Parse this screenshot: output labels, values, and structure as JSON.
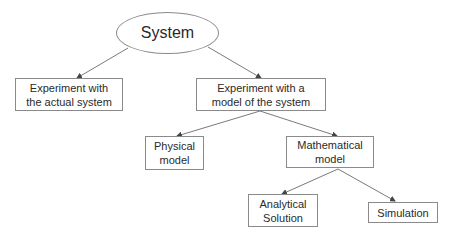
{
  "diagram": {
    "type": "tree",
    "root": {
      "label": "System",
      "shape": "ellipse"
    },
    "nodes": [
      {
        "id": "system",
        "label": "System",
        "shape": "ellipse",
        "x": 116,
        "y": 12,
        "w": 103,
        "h": 42
      },
      {
        "id": "actual",
        "label": "Experiment with\nthe actual system",
        "shape": "rect",
        "x": 15,
        "y": 78,
        "w": 108,
        "h": 33
      },
      {
        "id": "model",
        "label": "Experiment with a\nmodel of the system",
        "shape": "rect",
        "x": 196,
        "y": 78,
        "w": 130,
        "h": 33
      },
      {
        "id": "physical",
        "label": "Physical\nmodel",
        "shape": "rect",
        "x": 145,
        "y": 136,
        "w": 59,
        "h": 34
      },
      {
        "id": "math",
        "label": "Mathematical\nmodel",
        "shape": "rect",
        "x": 286,
        "y": 136,
        "w": 88,
        "h": 32
      },
      {
        "id": "analytical",
        "label": "Analytical\nSolution",
        "shape": "rect",
        "x": 248,
        "y": 194,
        "w": 70,
        "h": 33
      },
      {
        "id": "simulation",
        "label": "Simulation",
        "shape": "rect",
        "x": 368,
        "y": 202,
        "w": 70,
        "h": 21
      }
    ],
    "edges": [
      {
        "from": "system",
        "to": "actual",
        "x1": 128,
        "y1": 48,
        "x2": 77,
        "y2": 78
      },
      {
        "from": "system",
        "to": "model",
        "x1": 208,
        "y1": 47,
        "x2": 261,
        "y2": 78
      },
      {
        "from": "model",
        "to": "physical",
        "x1": 260,
        "y1": 111,
        "x2": 177,
        "y2": 136
      },
      {
        "from": "model",
        "to": "math",
        "x1": 260,
        "y1": 111,
        "x2": 337,
        "y2": 136
      },
      {
        "from": "math",
        "to": "analytical",
        "x1": 338,
        "y1": 169,
        "x2": 282,
        "y2": 194
      },
      {
        "from": "math",
        "to": "simulation",
        "x1": 338,
        "y1": 169,
        "x2": 395,
        "y2": 201
      }
    ],
    "colors": {
      "line": "#7a7a7a",
      "border": "#8a8a8a",
      "text": "#2a2a2a",
      "background": "#ffffff"
    }
  }
}
